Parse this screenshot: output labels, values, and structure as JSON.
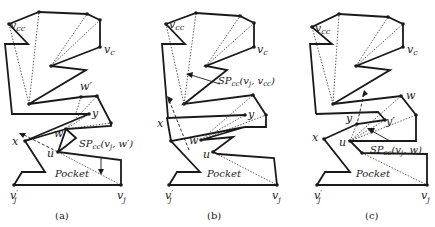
{
  "figure": {
    "panels": [
      {
        "id": "a",
        "caption": "(a)",
        "labels": {
          "v_cc": "vcc",
          "v_c": "vc",
          "w_prime": "w′",
          "y": "y",
          "w": "w",
          "x": "x",
          "u": "u",
          "sp": "SPcc(vj, w′)",
          "pocket": "Pocket",
          "v_j_prime": "v′j",
          "v_j": "vj"
        }
      },
      {
        "id": "b",
        "caption": "(b)",
        "labels": {
          "v_cc": "vcc",
          "v_c": "vc",
          "sp": "SPcc(vj, vcc)",
          "y": "y",
          "x": "x",
          "w": "w",
          "u": "u",
          "pocket": "Pocket",
          "v_j_prime": "v′j",
          "v_j": "vj"
        }
      },
      {
        "id": "c",
        "caption": "(c)",
        "labels": {
          "v_cc": "vcc",
          "v_c": "vc",
          "w": "w",
          "y": "y",
          "y_prime": "y′",
          "x": "x",
          "u": "u",
          "sp": "SPcc(vj, w)",
          "pocket": "Pocket",
          "v_j_prime": "v′j",
          "v_j": "vj"
        }
      }
    ]
  },
  "sp_parts": {
    "a": {
      "base": "SP",
      "sub": "cc",
      "args": "(v",
      "argsub": "j",
      "tail": ", w′)"
    },
    "b": {
      "base": "SP",
      "sub": "cc",
      "args": "(v",
      "argsub": "j",
      "tail": ", v",
      "tailsub": "cc",
      "end": ")"
    },
    "c": {
      "base": "SP",
      "sub": "cc",
      "args": "(v",
      "argsub": "j",
      "tail": ", w)"
    }
  },
  "common": {
    "v": "v",
    "cc": "cc",
    "c": "c",
    "j": "j",
    "prime": "′",
    "pocket": "Pocket"
  }
}
